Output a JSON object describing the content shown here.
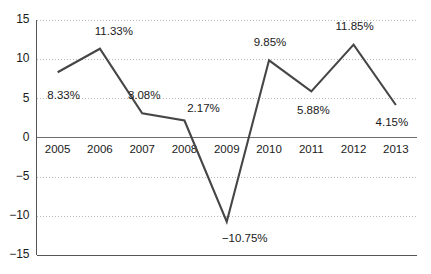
{
  "chart_data": {
    "type": "line",
    "title": "",
    "subtitle": "",
    "xlabel": "",
    "ylabel": "",
    "categories": [
      "2005",
      "2006",
      "2007",
      "2008",
      "2009",
      "2010",
      "2011",
      "2012",
      "2013"
    ],
    "values": [
      8.33,
      11.33,
      3.08,
      2.17,
      -10.75,
      9.85,
      5.88,
      11.85,
      4.15
    ],
    "point_labels": [
      "8.33%",
      "11.33%",
      "3.08%",
      "2.17%",
      "−10.75%",
      "9.85%",
      "5.88%",
      "11.85%",
      "4.15%"
    ],
    "series": [
      {
        "name": "",
        "values": [
          8.33,
          11.33,
          3.08,
          2.17,
          -10.75,
          9.85,
          5.88,
          11.85,
          4.15
        ],
        "color": "#464646"
      }
    ],
    "ylim": [
      -15,
      15
    ],
    "yticks": [
      15,
      10,
      5,
      0,
      -5,
      -10,
      -15
    ],
    "ytick_labels": [
      "15",
      "10",
      "5",
      "0",
      "−5",
      "−10",
      "−15"
    ],
    "grid": true,
    "grid_style": "dotted",
    "legend": false,
    "legend_position": "none",
    "zero_line": true,
    "colors": {
      "line": "#464646",
      "grid": "#b8b8b8",
      "axis": "#555555",
      "zero_axis": "#6e6e6e",
      "text": "#1a1a1a",
      "background": "#ffffff"
    },
    "label_offsets": [
      {
        "dx": 6,
        "dy": 24
      },
      {
        "dx": 14,
        "dy": -17
      },
      {
        "dx": 2,
        "dy": -17
      },
      {
        "dx": 19,
        "dy": -12
      },
      {
        "dx": 18,
        "dy": 17
      },
      {
        "dx": 1,
        "dy": -17
      },
      {
        "dx": 2,
        "dy": 20
      },
      {
        "dx": 1,
        "dy": -18
      },
      {
        "dx": -4,
        "dy": 18
      }
    ]
  }
}
